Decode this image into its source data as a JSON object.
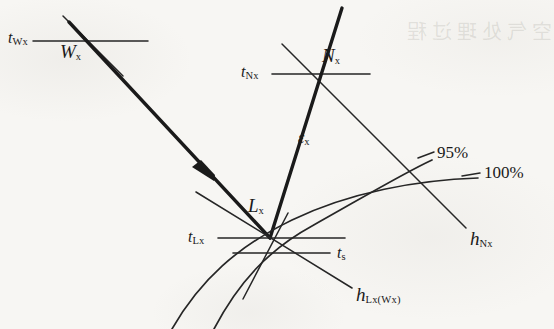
{
  "figure": {
    "type": "psychrometric-process-diagram",
    "background_color": "#f7f6f3",
    "ink_color": "#1f1f1f",
    "bleed_through_text": "空气处理过程",
    "nodes": [
      {
        "id": "Wx",
        "label": "W",
        "sub": "x",
        "x": 88,
        "y": 41,
        "temp_label": "t",
        "temp_sub": "Wx"
      },
      {
        "id": "Nx",
        "label": "N",
        "sub": "x",
        "x": 312,
        "y": 74,
        "temp_label": "t",
        "temp_sub": "Nx"
      },
      {
        "id": "Lx",
        "label": "L",
        "sub": "x",
        "x": 270,
        "y": 238,
        "temp_label": "t",
        "temp_sub": "Lx"
      }
    ],
    "labels": {
      "t_Wx": "t",
      "t_Wx_sub": "Wx",
      "W_x": "W",
      "W_x_sub": "x",
      "t_Nx": "t",
      "t_Nx_sub": "Nx",
      "N_x": "N",
      "N_x_sub": "x",
      "epsilon_x": "ε",
      "epsilon_x_sub": "x",
      "L_x": "L",
      "L_x_sub": "x",
      "t_Lx": "t",
      "t_Lx_sub": "Lx",
      "t_s": "t",
      "t_s_sub": "s",
      "h_Nx": "h",
      "h_Nx_sub": "Nx",
      "h_LxWx": "h",
      "h_LxWx_sub": "Lx(Wx)",
      "curve_95": "95%",
      "curve_100": "100%"
    },
    "curves": [
      {
        "name": "relative-humidity-95",
        "label": "95%",
        "label_x": 437,
        "label_y": 152
      },
      {
        "name": "relative-humidity-100",
        "label": "100%",
        "label_x": 483,
        "label_y": 172
      }
    ],
    "process_line": {
      "name": "Wx-to-Lx-process-line",
      "from": "Wx",
      "to": "Lx",
      "arrow_at_x": 205,
      "arrow_at_y": 172,
      "weight": "thick"
    }
  }
}
